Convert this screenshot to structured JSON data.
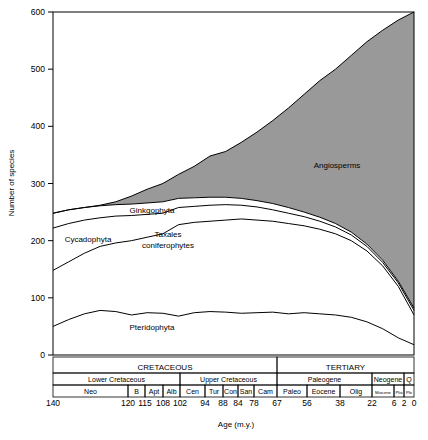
{
  "chart_data": {
    "type": "area",
    "title": "",
    "xlabel": "Age (m.y.)",
    "ylabel": "Number of species",
    "ylim": [
      0,
      600
    ],
    "xlim": [
      140,
      0
    ],
    "y_ticks": [
      0,
      100,
      200,
      300,
      400,
      500,
      600
    ],
    "x_ticks": [
      140,
      120,
      115,
      108,
      102,
      94,
      88,
      84,
      78,
      67,
      56,
      38,
      22,
      6,
      2,
      0
    ],
    "grid": false,
    "legend_position": "inline-annotations",
    "stack_order_bottom_to_top": [
      "Pteridophyta",
      "Taxales coniferophytes",
      "Cycadophyta",
      "Ginkgophyta",
      "Angiosperms"
    ],
    "series": [
      {
        "name": "Pteridophyta",
        "label": "Pteridophyta",
        "fill": "#ffffff",
        "cumulative_top": [
          50,
          62,
          72,
          78,
          76,
          70,
          74,
          73,
          68,
          74,
          76,
          75,
          73,
          74,
          75,
          72,
          74,
          72,
          70,
          66,
          58,
          46,
          30,
          18
        ]
      },
      {
        "name": "Taxales coniferophytes",
        "label": "Taxales coniferophytes",
        "fill": "#ffffff",
        "cumulative_top": [
          148,
          163,
          178,
          190,
          196,
          200,
          206,
          212,
          228,
          232,
          234,
          236,
          238,
          236,
          234,
          230,
          226,
          220,
          212,
          200,
          182,
          156,
          120,
          70
        ]
      },
      {
        "name": "Cycadophyta",
        "label": "Cycadophyta",
        "fill": "#ffffff",
        "cumulative_top": [
          222,
          230,
          236,
          240,
          243,
          244,
          246,
          248,
          258,
          260,
          262,
          263,
          262,
          259,
          254,
          248,
          242,
          234,
          224,
          210,
          190,
          162,
          126,
          78
        ]
      },
      {
        "name": "Ginkgophyta",
        "label": "Ginkgophyta",
        "fill": "#ffffff",
        "cumulative_top": [
          248,
          254,
          258,
          261,
          263,
          264,
          266,
          268,
          274,
          275,
          276,
          276,
          274,
          270,
          265,
          258,
          250,
          241,
          230,
          215,
          194,
          166,
          129,
          82
        ]
      },
      {
        "name": "Angiosperms",
        "label": "Angiosperms",
        "fill": "#999999",
        "cumulative_top": [
          248,
          254,
          258,
          262,
          268,
          278,
          290,
          300,
          316,
          330,
          348,
          356,
          372,
          390,
          410,
          432,
          456,
          480,
          500,
          524,
          548,
          568,
          586,
          600
        ]
      }
    ],
    "timescale": {
      "era_row": [
        {
          "label": "CRETACEOUS",
          "from": 140,
          "to": 67
        },
        {
          "label": "TERTIARY",
          "from": 67,
          "to": 0
        }
      ],
      "epoch_row": [
        {
          "label": "Lower Cretaceous",
          "from": 140,
          "to": 102
        },
        {
          "label": "Upper Cretaceous",
          "from": 102,
          "to": 67
        },
        {
          "label": "Paleogene",
          "from": 67,
          "to": 22
        },
        {
          "label": "Neogene",
          "from": 22,
          "to": 2
        },
        {
          "label": "Q",
          "from": 2,
          "to": 0
        }
      ],
      "stage_row": [
        {
          "label": "Neo",
          "from": 140,
          "to": 120
        },
        {
          "label": "B",
          "from": 120,
          "to": 115
        },
        {
          "label": "Apt",
          "from": 115,
          "to": 108
        },
        {
          "label": "Alb",
          "from": 108,
          "to": 102
        },
        {
          "label": "Cen",
          "from": 102,
          "to": 94
        },
        {
          "label": "Tur",
          "from": 94,
          "to": 88
        },
        {
          "label": "Con",
          "from": 88,
          "to": 84
        },
        {
          "label": "San",
          "from": 84,
          "to": 78
        },
        {
          "label": "Cam",
          "from": 78,
          "to": 67
        },
        {
          "label": "Paleo",
          "from": 67,
          "to": 56
        },
        {
          "label": "Eocene",
          "from": 56,
          "to": 38
        },
        {
          "label": "Olig",
          "from": 38,
          "to": 22
        },
        {
          "label": "Miocene",
          "from": 22,
          "to": 6
        },
        {
          "label": "Plio",
          "from": 6,
          "to": 2
        },
        {
          "label": "Ple",
          "from": 2,
          "to": 0
        }
      ]
    }
  }
}
